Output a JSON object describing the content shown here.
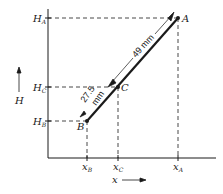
{
  "diagram": {
    "type": "geometric-construction",
    "axes": {
      "y_axis_label": "H",
      "x_axis_label": "x",
      "y_ticks": [
        {
          "name": "H",
          "sub": "A",
          "y": 18
        },
        {
          "name": "H",
          "sub": "C",
          "y": 87
        },
        {
          "name": "H",
          "sub": "B",
          "y": 121
        }
      ],
      "x_ticks": [
        {
          "name": "x",
          "sub": "B",
          "x": 87
        },
        {
          "name": "x",
          "sub": "C",
          "x": 118
        },
        {
          "name": "x",
          "sub": "A",
          "x": 178
        }
      ]
    },
    "points": {
      "A": {
        "label": "A",
        "x": 178,
        "y": 18
      },
      "B": {
        "label": "B",
        "x": 87,
        "y": 121
      },
      "C": {
        "label": "C",
        "x": 118,
        "y": 87
      }
    },
    "dimensions": {
      "AC": {
        "text": "49 mm"
      },
      "BC": {
        "line1": "27.5",
        "line2": "mm"
      }
    },
    "colors": {
      "ink": "#1a1a1a",
      "background": "#ffffff"
    }
  }
}
